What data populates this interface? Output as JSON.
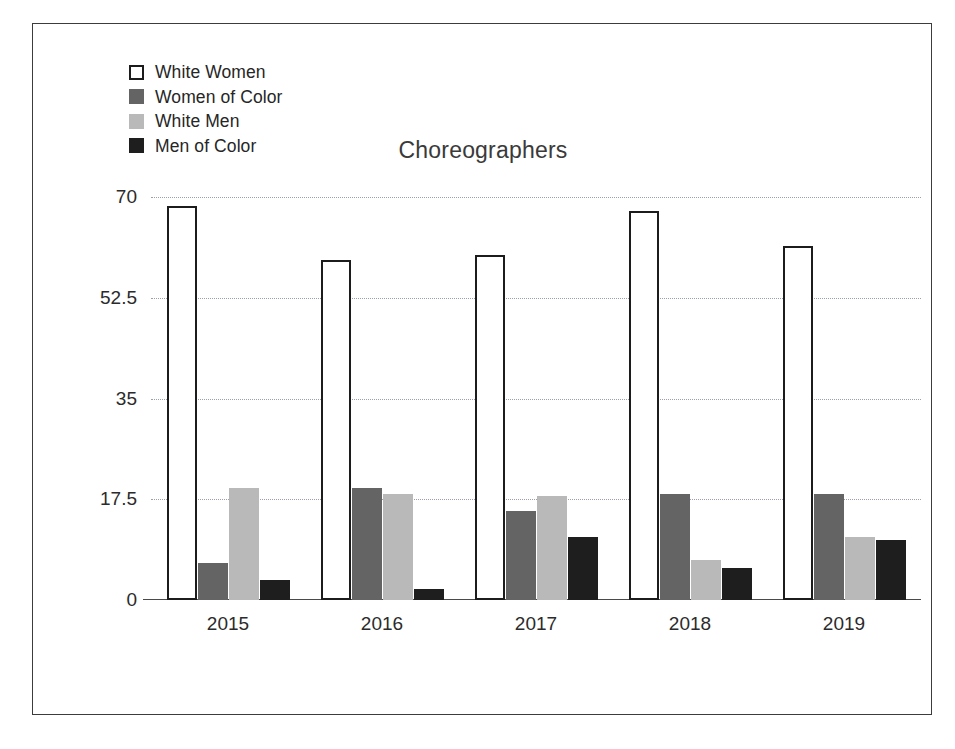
{
  "chart_data": {
    "type": "bar",
    "title": "Choreographers",
    "xlabel": "",
    "ylabel": "",
    "categories": [
      "2015",
      "2016",
      "2017",
      "2018",
      "2019"
    ],
    "series": [
      {
        "name": "White Women",
        "color": "#ffffff",
        "border": "#1c1c1c",
        "values": [
          68.5,
          59,
          60,
          67.5,
          61.5
        ]
      },
      {
        "name": "Women of Color",
        "color": "#646464",
        "border": "#646464",
        "values": [
          6.5,
          19.5,
          15.5,
          18.5,
          18.5
        ]
      },
      {
        "name": "White Men",
        "color": "#b9b9b9",
        "border": "#b9b9b9",
        "values": [
          19.5,
          18.5,
          18,
          7,
          11
        ]
      },
      {
        "name": "Men of Color",
        "color": "#1e1e1e",
        "border": "#1e1e1e",
        "values": [
          3.5,
          2,
          11,
          5.5,
          10.5
        ]
      }
    ],
    "ylim": [
      0,
      70
    ],
    "yticks": [
      0,
      17.5,
      35,
      52.5,
      70
    ],
    "ytick_labels": [
      "0",
      "17.5",
      "35",
      "52.5",
      "70"
    ],
    "grid": true,
    "legend_position": "top-left"
  },
  "legend": {
    "items": [
      {
        "label": "White Women"
      },
      {
        "label": "Women of Color"
      },
      {
        "label": "White Men"
      },
      {
        "label": "Men of Color"
      }
    ]
  },
  "axis": {
    "ytick_labels": [
      "70",
      "52.5",
      "35",
      "17.5",
      "0"
    ],
    "xtick_labels": [
      "2015",
      "2016",
      "2017",
      "2018",
      "2019"
    ]
  }
}
